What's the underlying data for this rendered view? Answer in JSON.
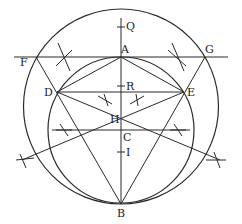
{
  "diagram": {
    "stroke_color": "#2a2a2a",
    "background": "#ffffff",
    "labels": {
      "Q": "Q",
      "A": "A",
      "F": "F",
      "G": "G",
      "D": "D",
      "E": "E",
      "R": "R",
      "H": "H",
      "C": "C",
      "I": "I",
      "B": "B"
    },
    "points": {
      "A": [
        121,
        57
      ],
      "B": [
        121,
        204
      ],
      "C": [
        121,
        130
      ],
      "D": [
        57,
        92
      ],
      "E": [
        184,
        92
      ],
      "F": [
        36,
        57
      ],
      "G": [
        205,
        57
      ],
      "R": [
        121,
        92
      ],
      "H": [
        121,
        119
      ],
      "Q": [
        121,
        27
      ],
      "I": [
        121,
        152
      ]
    },
    "circles": [
      {
        "name": "outer-circle",
        "center": [
          121,
          106.5
        ],
        "radius": 97.5
      },
      {
        "name": "inner-circle",
        "center": [
          121,
          130
        ],
        "radius": 73
      }
    ]
  }
}
